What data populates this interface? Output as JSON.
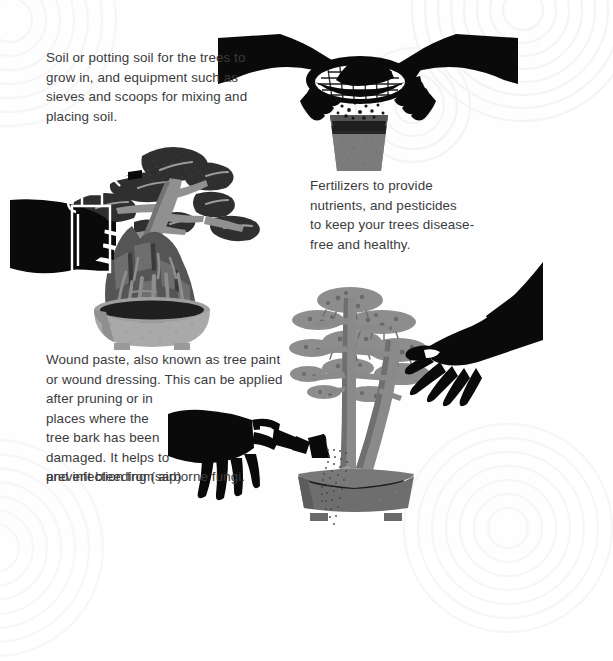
{
  "page": {
    "background_color": "#fefefe",
    "text_color": "#3b3b3d",
    "ink_black": "#0a0a0a",
    "pot_gray": "#7b7b7b",
    "soil_dark": "#2a2a2a",
    "foliage_gray": "#8a8a8a",
    "rock_gray": "#595959",
    "light_pot_gray": "#a9a9a9"
  },
  "captions": {
    "soil": "Soil or potting soil for the trees to\ngrow in, and equipment such as\nsieves and scoops for mixing and\nplacing soil.",
    "fertilizer": "Fertilizers to provide\nnutrients, and pesticides\nto keep your trees disease-\nfree and healthy.",
    "wound_part1": "Wound paste, also known as tree paint\nor wound dressing. This can be applied",
    "wound_part2": "after pruning or in\nplaces where the\ntree bark has been\ndamaged. It helps to\nprevent bleeding (sap)",
    "wound_part3": "and infection from airborne fungi."
  },
  "illustrations": {
    "sieving": {
      "name": "hands-sieving-soil-into-pot",
      "elements": [
        "left-hand-silhouette",
        "right-hand-silhouette",
        "mesh-sieve",
        "falling-soil-grains",
        "plastic-pot"
      ]
    },
    "misting": {
      "name": "hand-misting-root-over-rock-bonsai",
      "elements": [
        "hand-silhouette",
        "spray-bottle",
        "mist-spray-dots",
        "bonsai-canopy",
        "rock",
        "exposed-roots",
        "oval-bowl-pot"
      ]
    },
    "wound_paste": {
      "name": "hand-with-watering-can-rose",
      "elements": [
        "hand-silhouette",
        "watering-can-rose",
        "water-stream-dots"
      ]
    },
    "pine": {
      "name": "literati-pine-bonsai-with-hand",
      "elements": [
        "foliage-pads",
        "twin-trunks",
        "surface-roots",
        "rectangular-pot",
        "hand-silhouette-applying-paste"
      ]
    }
  }
}
